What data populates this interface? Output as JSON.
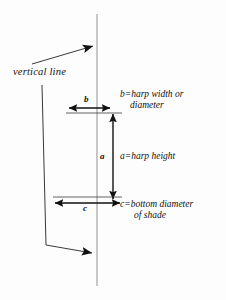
{
  "diagram": {
    "background_color": "#fdfdfd",
    "ink_color": "#111111",
    "guide_color": "#9a9a9a",
    "labels": {
      "vertical_line": "vertical line",
      "b_variable": "b",
      "a_variable": "a",
      "c_variable": "c",
      "b_definition_line1": "b=harp width or",
      "b_definition_line2": "diameter",
      "a_definition": "a=harp height",
      "c_definition_line1": "c=bottom diameter",
      "c_definition_line2": "of shade"
    },
    "measurements": [
      {
        "symbol": "b",
        "meaning": "harp width or diameter",
        "orientation": "horizontal",
        "arrow_y": 108,
        "arrow_x_start": 68,
        "arrow_x_end": 110
      },
      {
        "symbol": "a",
        "meaning": "harp height",
        "orientation": "vertical",
        "arrow_x": 113,
        "arrow_y_start": 113,
        "arrow_y_end": 198
      },
      {
        "symbol": "c",
        "meaning": "bottom diameter of shade",
        "orientation": "horizontal",
        "arrow_y": 203,
        "arrow_x_start": 53,
        "arrow_x_end": 121
      }
    ],
    "vertical_axis": {
      "x": 97,
      "y_top": 14,
      "y_bottom": 286
    },
    "leaders": [
      {
        "name": "upper-leader",
        "from_x": 32,
        "from_y": 64,
        "to_x": 93,
        "to_y": 46
      },
      {
        "name": "lower-leader",
        "from_x": 42,
        "from_y": 85,
        "to_x": 92,
        "to_y": 253
      }
    ]
  }
}
